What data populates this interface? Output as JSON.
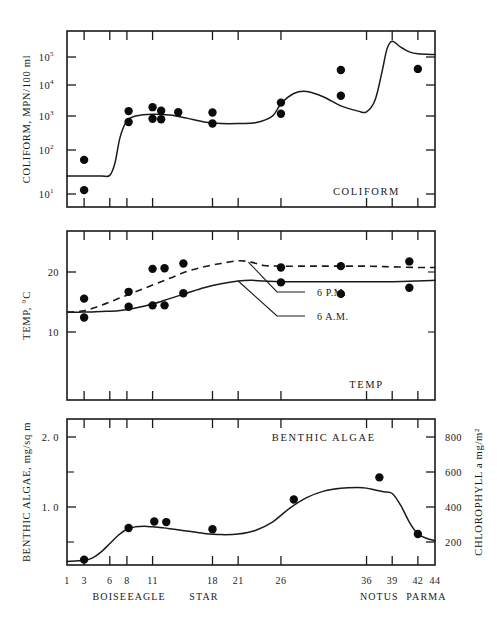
{
  "figure": {
    "background": "#ffffff",
    "ink": "#1a1a1a",
    "plot_left": 67,
    "plot_right": 435,
    "x_domain": [
      1,
      44
    ]
  },
  "chart_data": [
    {
      "type": "line",
      "id": "coliform",
      "title": "COLIFORM",
      "panel_tag": "COLIFORM",
      "xlabel": "",
      "ylabel": "COLIFORM, MPN/100 ml",
      "yscale": "log",
      "ylim": [
        6,
        1000000
      ],
      "xlim": [
        1,
        44
      ],
      "grid": false,
      "ytick_values": [
        10,
        100,
        1000,
        10000,
        100000
      ],
      "ytick_labels": [
        "10",
        "10",
        "10",
        "10",
        "10"
      ],
      "ytick_exponents": [
        "1",
        "2",
        "3",
        "4",
        "5"
      ],
      "ytick_pixels": [
        194,
        150,
        116,
        85,
        57
      ],
      "xtick_values": [
        1,
        3,
        6,
        8,
        11,
        18,
        21,
        26,
        36,
        39,
        42,
        44
      ],
      "series": [
        {
          "name": "coliform trend",
          "style": "solid",
          "x": [
            1,
            3,
            5,
            6,
            6.6,
            7.2,
            8,
            9,
            11,
            13,
            15,
            17,
            19,
            21,
            23,
            25,
            26,
            27.5,
            29,
            31,
            33,
            35,
            36,
            37,
            37.8,
            38.4,
            39,
            40,
            41,
            42,
            44
          ],
          "y": [
            50,
            50,
            50,
            52,
            120,
            700,
            2200,
            3000,
            3400,
            3200,
            2600,
            2000,
            1800,
            1800,
            1900,
            3000,
            7000,
            14000,
            16000,
            11000,
            6000,
            4200,
            4000,
            9000,
            60000,
            300000,
            500000,
            330000,
            240000,
            210000,
            200000
          ]
        }
      ],
      "points": [
        {
          "x": 3,
          "y": 150
        },
        {
          "x": 3,
          "y": 19
        },
        {
          "x": 8.2,
          "y": 4200
        },
        {
          "x": 8.2,
          "y": 2000
        },
        {
          "x": 11,
          "y": 5500
        },
        {
          "x": 11,
          "y": 2500
        },
        {
          "x": 12,
          "y": 4300
        },
        {
          "x": 12,
          "y": 2400
        },
        {
          "x": 14,
          "y": 3900
        },
        {
          "x": 18,
          "y": 3800
        },
        {
          "x": 18,
          "y": 1800
        },
        {
          "x": 26,
          "y": 7500
        },
        {
          "x": 26,
          "y": 3500
        },
        {
          "x": 33,
          "y": 70000
        },
        {
          "x": 33,
          "y": 12000
        },
        {
          "x": 42,
          "y": 75000
        }
      ]
    },
    {
      "type": "line",
      "id": "temp",
      "title": "TEMP",
      "panel_tag": "TEMP",
      "xlabel": "",
      "ylabel": "TEMP, °C",
      "yscale": "linear",
      "ylim": [
        2,
        27
      ],
      "xlim": [
        1,
        44
      ],
      "grid": false,
      "ytick_values": [
        10,
        20
      ],
      "ytick_labels": [
        "10",
        "20"
      ],
      "ytick_pixels": [
        332,
        272
      ],
      "xtick_values": [
        1,
        3,
        6,
        8,
        11,
        18,
        21,
        26,
        36,
        39,
        42,
        44
      ],
      "annotations": [
        {
          "label": "6 P.M.",
          "target_series": "6 P.M.",
          "text_x": 317,
          "text_y": 296
        },
        {
          "label": "6 A.M.",
          "target_series": "6 A.M.",
          "text_x": 317,
          "text_y": 320
        }
      ],
      "series": [
        {
          "name": "6 P.M.",
          "style": "dashed",
          "x": [
            1,
            3,
            5,
            7,
            9,
            11,
            13,
            15,
            17,
            19,
            21,
            22.5,
            24,
            26,
            29,
            32,
            36,
            39,
            42,
            44
          ],
          "y": [
            15.0,
            15.2,
            16.0,
            17.0,
            18.0,
            19.0,
            20.0,
            21.0,
            21.7,
            22.2,
            22.6,
            22.4,
            21.9,
            21.8,
            21.8,
            21.8,
            21.8,
            21.7,
            21.6,
            21.6
          ]
        },
        {
          "name": "6 A.M.",
          "style": "solid",
          "x": [
            1,
            3,
            5,
            7,
            9,
            11,
            13,
            15,
            17,
            19,
            21,
            22.5,
            24,
            26,
            29,
            32,
            36,
            39,
            42,
            44
          ],
          "y": [
            15.0,
            15.0,
            15.1,
            15.2,
            15.6,
            16.2,
            17.0,
            17.8,
            18.6,
            19.2,
            19.6,
            19.7,
            19.6,
            19.5,
            19.5,
            19.5,
            19.5,
            19.5,
            19.6,
            19.7
          ]
        }
      ],
      "points": [
        {
          "x": 3,
          "y": 17.0
        },
        {
          "x": 3,
          "y": 14.2
        },
        {
          "x": 8.2,
          "y": 18.0
        },
        {
          "x": 8.2,
          "y": 15.8
        },
        {
          "x": 11,
          "y": 21.4
        },
        {
          "x": 11,
          "y": 16.0
        },
        {
          "x": 12.4,
          "y": 21.5
        },
        {
          "x": 12.4,
          "y": 16.0
        },
        {
          "x": 14.6,
          "y": 22.2
        },
        {
          "x": 14.6,
          "y": 17.8
        },
        {
          "x": 26,
          "y": 21.6
        },
        {
          "x": 26,
          "y": 19.4
        },
        {
          "x": 33,
          "y": 21.8
        },
        {
          "x": 33,
          "y": 17.7
        },
        {
          "x": 41,
          "y": 22.5
        },
        {
          "x": 41,
          "y": 18.6
        }
      ]
    },
    {
      "type": "line",
      "id": "benthic_algae",
      "title": "BENTHIC ALGAE",
      "panel_tag": "BENTHIC ALGAE",
      "xlabel": "",
      "ylabel": "BENTHIC ALGAE, mg/sq m",
      "ylabel_right": "CHLOROPHYLL a mg/m²",
      "yscale": "linear",
      "ylim": [
        0,
        2.45
      ],
      "xlim": [
        1,
        44
      ],
      "grid": false,
      "ytick_values": [
        1.0,
        2.0
      ],
      "ytick_labels": [
        "1. 0",
        "2. 0"
      ],
      "ytick_pixels": [
        507,
        437
      ],
      "yminor_pixels": [
        472,
        542
      ],
      "ytick_values_right": [
        200,
        400,
        600,
        800
      ],
      "ytick_labels_right": [
        "200",
        "400",
        "600",
        "800"
      ],
      "ytick_pixels_right": [
        542,
        507,
        472,
        437
      ],
      "xtick_values": [
        1,
        3,
        6,
        8,
        11,
        18,
        21,
        26,
        36,
        39,
        42,
        44
      ],
      "series": [
        {
          "name": "benthic algae trend",
          "style": "solid",
          "x": [
            1,
            3,
            4,
            5,
            6,
            7,
            8,
            9,
            10,
            11,
            13,
            15,
            17,
            19,
            21,
            23,
            25,
            27,
            29,
            31,
            33,
            35,
            36,
            37,
            38,
            39,
            40,
            41,
            42,
            43,
            44
          ],
          "y": [
            0.06,
            0.08,
            0.12,
            0.22,
            0.36,
            0.5,
            0.6,
            0.64,
            0.65,
            0.64,
            0.61,
            0.57,
            0.53,
            0.51,
            0.52,
            0.58,
            0.72,
            0.95,
            1.13,
            1.24,
            1.29,
            1.3,
            1.29,
            1.26,
            1.23,
            1.2,
            1.0,
            0.72,
            0.52,
            0.45,
            0.41
          ]
        }
      ],
      "points": [
        {
          "x": 3,
          "y": 0.09
        },
        {
          "x": 8.2,
          "y": 0.62
        },
        {
          "x": 11.2,
          "y": 0.73
        },
        {
          "x": 12.6,
          "y": 0.72
        },
        {
          "x": 18,
          "y": 0.6
        },
        {
          "x": 27.5,
          "y": 1.1
        },
        {
          "x": 37.5,
          "y": 1.47
        },
        {
          "x": 42,
          "y": 0.52
        }
      ]
    }
  ],
  "xaxis": {
    "ticks": [
      {
        "value": "1",
        "pos": 1
      },
      {
        "value": "3",
        "pos": 3
      },
      {
        "value": "6",
        "pos": 6
      },
      {
        "value": "8",
        "pos": 8
      },
      {
        "value": "11",
        "pos": 11
      },
      {
        "value": "18",
        "pos": 18
      },
      {
        "value": "21",
        "pos": 21
      },
      {
        "value": "26",
        "pos": 26
      },
      {
        "value": "36",
        "pos": 36
      },
      {
        "value": "39",
        "pos": 39
      },
      {
        "value": "42",
        "pos": 42
      },
      {
        "value": "44",
        "pos": 44
      }
    ],
    "places": [
      {
        "name": "BOISE",
        "pos": 6
      },
      {
        "name": "EAGLE",
        "pos": 10.3
      },
      {
        "name": "STAR",
        "pos": 17
      },
      {
        "name": "NOTUS",
        "pos": 37.5
      },
      {
        "name": "PARMA",
        "pos": 43
      }
    ]
  }
}
